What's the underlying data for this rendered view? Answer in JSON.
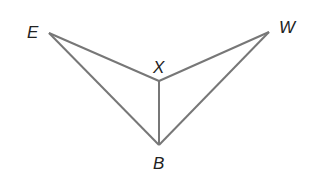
{
  "diagram": {
    "stroke_color": "#777777",
    "points": {
      "E": {
        "label": "E",
        "x": 49,
        "y": 33
      },
      "W": {
        "label": "W",
        "x": 269,
        "y": 32
      },
      "X": {
        "label": "X",
        "x": 159,
        "y": 81
      },
      "B": {
        "label": "B",
        "x": 159,
        "y": 145
      }
    },
    "segments": [
      "EX",
      "XW",
      "EB",
      "WB",
      "XB"
    ]
  }
}
